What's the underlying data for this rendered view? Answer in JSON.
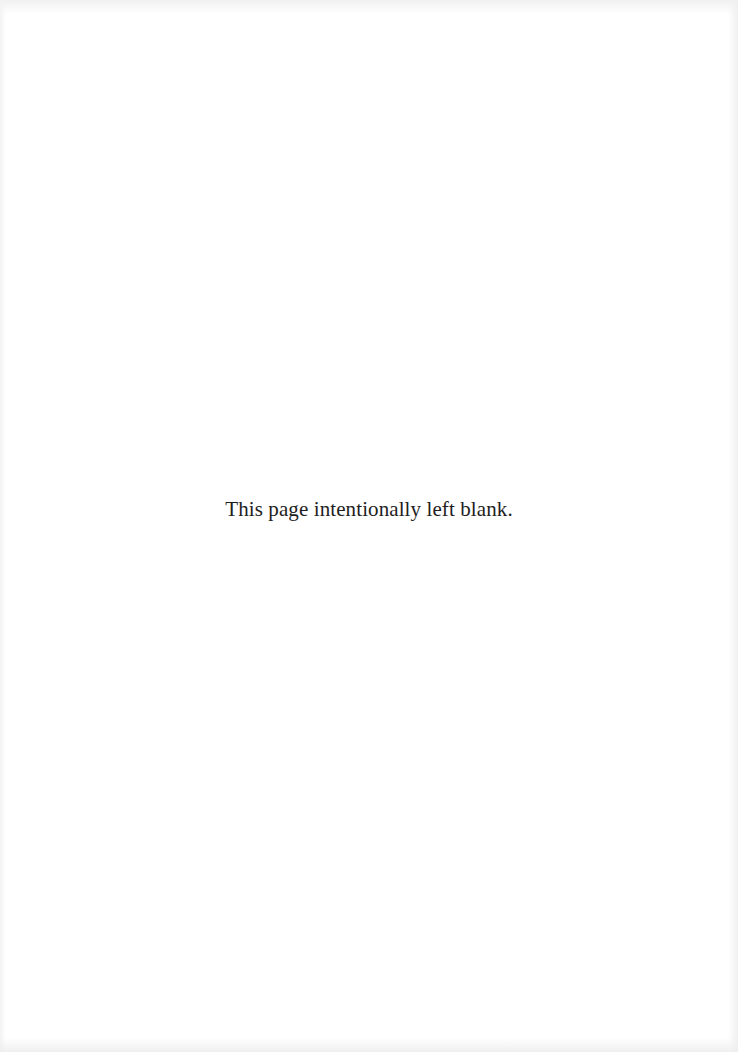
{
  "page": {
    "notice": "This page intentionally left blank.",
    "background_color": "#ffffff",
    "text_color": "#1e1e1e"
  }
}
